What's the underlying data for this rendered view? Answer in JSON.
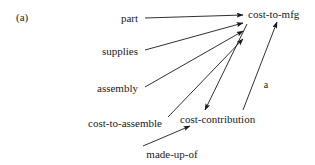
{
  "figure": {
    "tag": "(a)",
    "tag_x": 16,
    "tag_y": 17,
    "width": 315,
    "height": 165,
    "background": "#ffffff",
    "ink": "#1a1a1a"
  },
  "nodes": [
    {
      "id": "part",
      "label": "part",
      "x": 138,
      "y": 18,
      "anchor": "end"
    },
    {
      "id": "supplies",
      "label": "supplies",
      "x": 138,
      "y": 51,
      "anchor": "end"
    },
    {
      "id": "assembly",
      "label": "assembly",
      "x": 138,
      "y": 88,
      "anchor": "end"
    },
    {
      "id": "cost-to-assemble",
      "label": "cost-to-assemble",
      "x": 162,
      "y": 123,
      "anchor": "end"
    },
    {
      "id": "made-up-of",
      "label": "made-up-of",
      "x": 172,
      "y": 154,
      "anchor": "middle"
    },
    {
      "id": "cost-contribution",
      "label": "cost-contribution",
      "x": 180,
      "y": 119,
      "anchor": "start"
    },
    {
      "id": "cost-to-mfg",
      "label": "cost-to-mfg",
      "x": 248,
      "y": 14,
      "anchor": "start"
    }
  ],
  "edges": [
    {
      "id": "part-to-cost-to-mfg",
      "from": "part",
      "to": "cost-to-mfg",
      "x1": 145,
      "y1": 18,
      "x2": 243,
      "y2": 15,
      "label": ""
    },
    {
      "id": "supplies-to-cost-to-mfg",
      "from": "supplies",
      "to": "cost-to-mfg",
      "x1": 145,
      "y1": 50,
      "x2": 243,
      "y2": 23,
      "label": ""
    },
    {
      "id": "assembly-to-cost-to-mfg",
      "from": "assembly",
      "to": "cost-to-mfg",
      "x1": 145,
      "y1": 87,
      "x2": 243,
      "y2": 31,
      "label": ""
    },
    {
      "id": "cost-to-assemble-to-cost-to-mfg",
      "from": "cost-to-assemble",
      "to": "cost-to-mfg",
      "x1": 168,
      "y1": 117,
      "x2": 243,
      "y2": 39,
      "label": ""
    },
    {
      "id": "cost-to-mfg-to-cost-contribution",
      "from": "cost-to-mfg",
      "to": "cost-contribution",
      "x1": 247,
      "y1": 24,
      "x2": 205,
      "y2": 110,
      "label": ""
    },
    {
      "id": "cost-contribution-to-cost-to-mfg",
      "from": "cost-contribution",
      "to": "cost-to-mfg",
      "x1": 243,
      "y1": 110,
      "x2": 277,
      "y2": 22,
      "label": "a",
      "label_x": 266,
      "label_y": 85
    }
  ],
  "extra_edges": [
    {
      "id": "made-up-of-to-cost-contribution",
      "from": "made-up-of",
      "to": "cost-contribution",
      "x1": 143,
      "y1": 146,
      "x2": 190,
      "y2": 126,
      "label": ""
    }
  ]
}
